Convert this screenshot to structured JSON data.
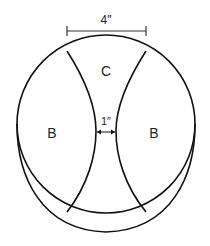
{
  "diagram": {
    "type": "ball-panel-diagram",
    "dimension_top": {
      "label": "4″"
    },
    "dimension_middle": {
      "label": "1″"
    },
    "panels": [
      {
        "id": "top",
        "label": "C"
      },
      {
        "id": "left",
        "label": "B"
      },
      {
        "id": "right",
        "label": "B"
      }
    ],
    "colors": {
      "stroke": "#111111",
      "text": "#222222",
      "background": "#ffffff"
    }
  }
}
